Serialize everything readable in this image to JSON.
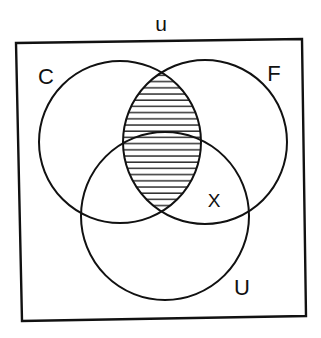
{
  "diagram": {
    "type": "venn",
    "universe_label": "u",
    "sets": [
      {
        "id": "C",
        "label": "C"
      },
      {
        "id": "F",
        "label": "F"
      },
      {
        "id": "U",
        "label": "U"
      }
    ],
    "region_markers": [
      {
        "label": "X",
        "region": "F ∩ U outside C"
      }
    ],
    "shaded_region": "C ∩ F (horizontal hatching)",
    "colors": {
      "stroke": "#111111",
      "background": "#ffffff"
    }
  }
}
